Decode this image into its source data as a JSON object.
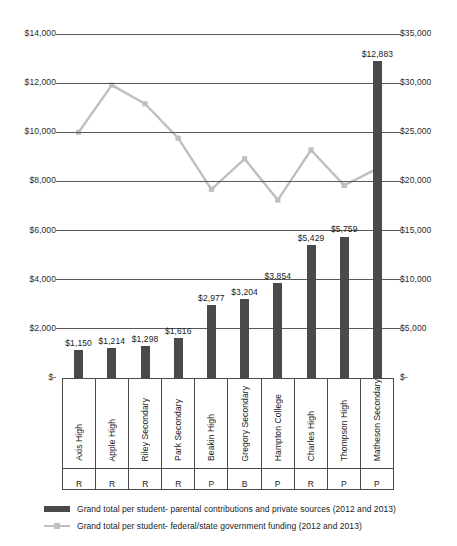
{
  "chart_data": {
    "type": "bar",
    "title": "",
    "xlabel": "",
    "ylabel": "",
    "grid": true,
    "legend_position": "bottom-left",
    "categories": [
      "Axis High",
      "Apple High",
      "Riley Secondary",
      "Park Secondary",
      "Beakin High",
      "Gregory Secondary",
      "Hampton College",
      "Charles High",
      "Thompson High",
      "Matheson Secondary"
    ],
    "category_codes": [
      "R",
      "R",
      "R",
      "R",
      "P",
      "B",
      "P",
      "R",
      "P",
      "P"
    ],
    "series": [
      {
        "name": "Grand total per student- parental contributions and private sources (2012 and 2013)",
        "type": "bar",
        "axis": "left",
        "color": "#4a4a4a",
        "values": [
          1150,
          1214,
          1298,
          1616,
          2977,
          3204,
          3854,
          5429,
          5759,
          12883
        ],
        "data_labels": [
          "$1,150",
          "$1,214",
          "$1,298",
          "$1,616",
          "$2,977",
          "$3,204",
          "$3,854",
          "$5,429",
          "$5,759",
          "$12,883"
        ]
      },
      {
        "name": "Grand total per student- federal/state government funding (2012 and 2013)",
        "type": "line",
        "axis": "right",
        "color": "#bfbfbf",
        "values": [
          25000,
          29800,
          27900,
          24400,
          19200,
          22300,
          18100,
          23200,
          19600,
          21300
        ]
      }
    ],
    "left_axis": {
      "ticks": [
        "$14,000",
        "$12,000",
        "$10,000",
        "$8,000",
        "$6,000",
        "$4,000",
        "$2,000",
        "$-"
      ],
      "values": [
        14000,
        12000,
        10000,
        8000,
        6000,
        4000,
        2000,
        0
      ],
      "ylim": [
        0,
        14000
      ]
    },
    "right_axis": {
      "ticks": [
        "$35,000",
        "$30,000",
        "$25,000",
        "$20,000",
        "$15,000",
        "$10,000",
        "$5,000",
        "$-"
      ],
      "values": [
        35000,
        30000,
        25000,
        20000,
        15000,
        10000,
        5000,
        0
      ],
      "ylim": [
        0,
        35000
      ]
    },
    "legend": [
      {
        "label": "Grand total per student- parental contributions and private sources (2012 and 2013)",
        "marker": "bar",
        "color": "#4a4a4a"
      },
      {
        "label": "Grand total per student- federal/state government funding (2012 and 2013)",
        "marker": "line",
        "color": "#bfbfbf"
      }
    ]
  },
  "colors": {
    "bar": "#4a4a4a",
    "line": "#bfbfbf",
    "gridline": "#595959",
    "text": "#1a1a1a"
  }
}
